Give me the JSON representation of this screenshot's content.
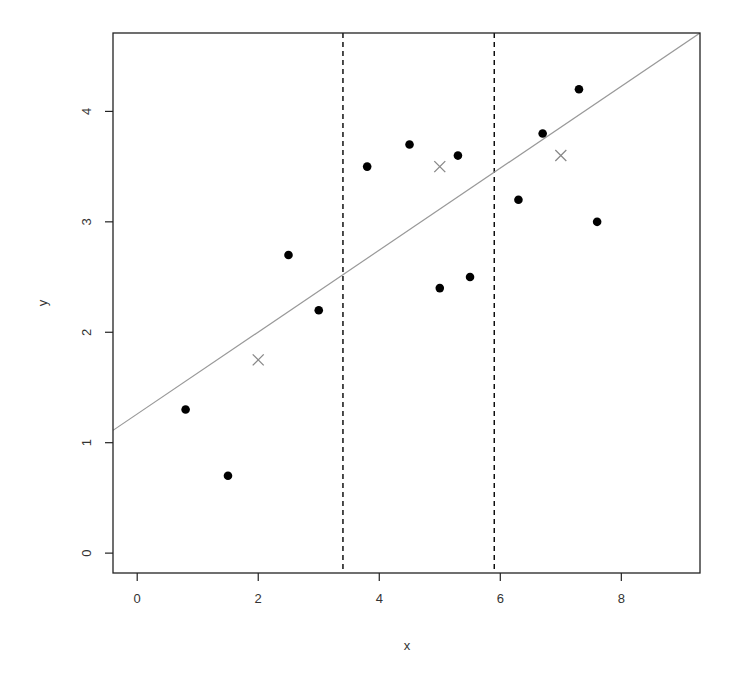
{
  "chart_data": {
    "type": "scatter",
    "title": "",
    "xlabel": "x",
    "ylabel": "y",
    "xlim": [
      -0.4,
      9.3
    ],
    "ylim": [
      -0.18,
      4.71
    ],
    "xticks": [
      0,
      2,
      4,
      6,
      8
    ],
    "yticks": [
      0,
      1,
      2,
      3,
      4
    ],
    "xtick_labels": [
      "0",
      "2",
      "4",
      "6",
      "8"
    ],
    "ytick_labels": [
      "0",
      "1",
      "2",
      "3",
      "4"
    ],
    "grid": false,
    "series": [
      {
        "name": "observations",
        "marker": "filled-circle",
        "color": "#000000",
        "points": [
          {
            "x": 0.8,
            "y": 1.3
          },
          {
            "x": 1.5,
            "y": 0.7
          },
          {
            "x": 2.5,
            "y": 2.7
          },
          {
            "x": 3.0,
            "y": 2.2
          },
          {
            "x": 3.8,
            "y": 3.5
          },
          {
            "x": 4.5,
            "y": 3.7
          },
          {
            "x": 5.0,
            "y": 2.4
          },
          {
            "x": 5.3,
            "y": 3.6
          },
          {
            "x": 5.5,
            "y": 2.5
          },
          {
            "x": 6.3,
            "y": 3.2
          },
          {
            "x": 6.7,
            "y": 3.8
          },
          {
            "x": 7.3,
            "y": 4.2
          },
          {
            "x": 7.6,
            "y": 3.0
          }
        ]
      },
      {
        "name": "region-means",
        "marker": "cross",
        "color": "#888888",
        "points": [
          {
            "x": 2.0,
            "y": 1.75
          },
          {
            "x": 5.0,
            "y": 3.5
          },
          {
            "x": 7.0,
            "y": 3.6
          }
        ]
      }
    ],
    "regression_line": {
      "intercept": 1.26,
      "slope": 0.371,
      "color": "#999999"
    },
    "vertical_lines": [
      {
        "x": 3.4,
        "style": "dashed",
        "color": "#000000"
      },
      {
        "x": 5.9,
        "style": "dashed",
        "color": "#000000"
      }
    ]
  }
}
